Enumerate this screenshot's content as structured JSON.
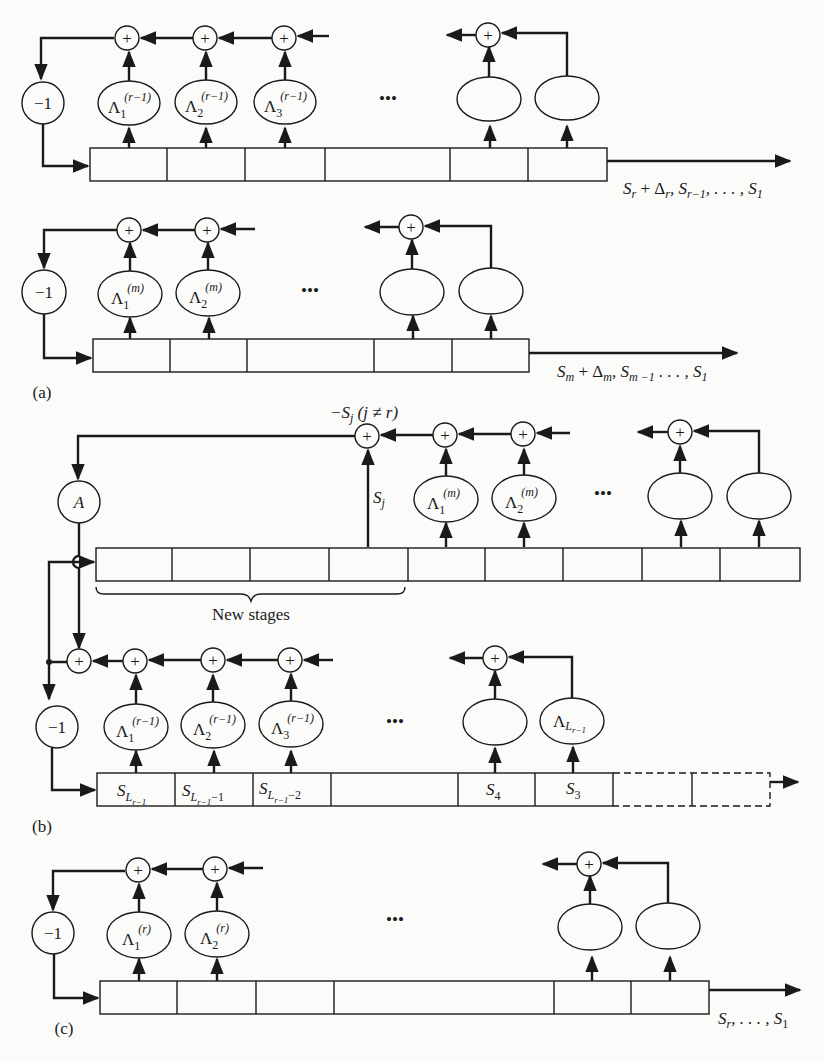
{
  "figure": {
    "panels": [
      {
        "id": "a",
        "label": "(a)",
        "rows": [
          {
            "negate_label": "−1",
            "adder_symbol": "+",
            "coefficients": [
              {
                "base": "Λ",
                "sub": "1",
                "sup": "(r−1)"
              },
              {
                "base": "Λ",
                "sub": "2",
                "sup": "(r−1)"
              },
              {
                "base": "Λ",
                "sub": "3",
                "sup": "(r−1)"
              },
              {
                "base": "",
                "sub": "",
                "sup": ""
              },
              {
                "base": "",
                "sub": "",
                "sup": ""
              }
            ],
            "ellipsis": "•••",
            "output_label": "S_r + Δ_r, S_{r−1}, . . . , S_1",
            "output_text": {
              "a": "S",
              "a_sub": "r",
              "b": " + Δ",
              "b_sub": "r",
              "c": ", S",
              "c_sub": "r−1",
              "d": ", . . . , S",
              "d_sub": "1"
            }
          },
          {
            "negate_label": "−1",
            "adder_symbol": "+",
            "coefficients": [
              {
                "base": "Λ",
                "sub": "1",
                "sup": "(m)"
              },
              {
                "base": "Λ",
                "sub": "2",
                "sup": "(m)"
              },
              {
                "base": "",
                "sub": "",
                "sup": ""
              },
              {
                "base": "",
                "sub": "",
                "sup": ""
              }
            ],
            "ellipsis": "•••",
            "output_label": "S_m + Δ_m, S_{m−1} . . . , S_1",
            "output_text": {
              "a": "S",
              "a_sub": "m",
              "b": " + Δ",
              "b_sub": "m",
              "c": ", S",
              "c_sub": "m −1",
              "d": " . . . , S",
              "d_sub": "1"
            }
          }
        ]
      },
      {
        "id": "b",
        "label": "(b)",
        "gain_label": "A",
        "correction_label": "−S_j (j ≠ r)",
        "correction_text": {
          "a": "−S",
          "a_sub": "j",
          "b": " (j ≠ r)"
        },
        "tap_label": {
          "a": "S",
          "a_sub": "j"
        },
        "new_stages_label": "New stages",
        "upper_coefficients": [
          {
            "base": "Λ",
            "sub": "1",
            "sup": "(m)"
          },
          {
            "base": "Λ",
            "sub": "2",
            "sup": "(m)"
          },
          {
            "base": "",
            "sub": "",
            "sup": ""
          },
          {
            "base": "",
            "sub": "",
            "sup": ""
          }
        ],
        "lower_coefficients": [
          {
            "base": "Λ",
            "sub": "1",
            "sup": "(r−1)"
          },
          {
            "base": "Λ",
            "sub": "2",
            "sup": "(r−1)"
          },
          {
            "base": "Λ",
            "sub": "3",
            "sup": "(r−1)"
          },
          {
            "base": "",
            "sub": "",
            "sup": ""
          },
          {
            "base": "Λ",
            "sub": "L",
            "subsub": "r−1",
            "sup": ""
          }
        ],
        "negate_label": "−1",
        "ellipsis": "•••",
        "register_cells": [
          {
            "base": "S",
            "sub": "L",
            "subsub": "r−1",
            "tail": ""
          },
          {
            "base": "S",
            "sub": "L",
            "subsub": "r−1",
            "tail": "−1"
          },
          {
            "base": "S",
            "sub": "L",
            "subsub": "r−1",
            "tail": "−2"
          },
          {
            "base": "",
            "sub": "",
            "subsub": "",
            "tail": ""
          },
          {
            "base": "S",
            "sub": "4",
            "subsub": "",
            "tail": ""
          },
          {
            "base": "S",
            "sub": "3",
            "subsub": "",
            "tail": ""
          }
        ]
      },
      {
        "id": "c",
        "label": "(c)",
        "negate_label": "−1",
        "coefficients": [
          {
            "base": "Λ",
            "sub": "1",
            "sup": "(r)"
          },
          {
            "base": "Λ",
            "sub": "2",
            "sup": "(r)"
          },
          {
            "base": "",
            "sub": "",
            "sup": ""
          },
          {
            "base": "",
            "sub": "",
            "sup": ""
          }
        ],
        "ellipsis": "•••",
        "output_label": "S_r, . . . , S_1",
        "output_text": {
          "a": "S",
          "a_sub": "r",
          "d": ", . . . , S",
          "d_sub": "1"
        }
      }
    ],
    "adder_symbol": "+",
    "colors": {
      "ink": "#1a1a1a",
      "paper": "#fbfbf9"
    }
  }
}
